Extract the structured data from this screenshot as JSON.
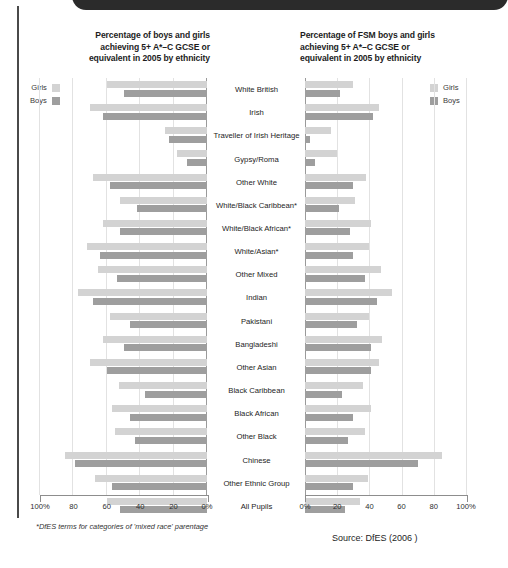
{
  "header": {
    "bar_color": "#2b2b2b"
  },
  "footnote": "*DfES terms for categories of  'mixed race' parentage",
  "source": "Source: DfES (2006 )",
  "legend": {
    "girls_label": "Girls",
    "boys_label": "Boys",
    "girls_color": "#d3d3d3",
    "boys_color": "#9e9e9e"
  },
  "axis": {
    "left_ticks": [
      "100%",
      "80",
      "60",
      "40",
      "20",
      "0%"
    ],
    "right_ticks": [
      "0%",
      "20",
      "40",
      "60",
      "80",
      "100%"
    ]
  },
  "chart_data": [
    {
      "type": "bar",
      "orientation": "horizontal",
      "direction": "right-to-left",
      "title": "Percentage of boys and girls achieving 5+ A*–C GCSE or equivalent in 2005 by ethnicity",
      "title_lines": [
        "Percentage of boys and girls",
        "achieving 5+ A*–C GCSE or",
        "equivalent in 2005 by ethnicity"
      ],
      "xlabel": "",
      "ylabel": "",
      "xlim": [
        0,
        100
      ],
      "xticks": [
        0,
        20,
        40,
        60,
        80,
        100
      ],
      "grid": true,
      "legend_position": "top-left",
      "categories": [
        "White British",
        "Irish",
        "Traveller of Irish Heritage",
        "Gypsy/Roma",
        "Other White",
        "White/Black Caribbean*",
        "White/Black African*",
        "White/Asian*",
        "Other Mixed",
        "Indian",
        "Pakistani",
        "Bangladeshi",
        "Other Asian",
        "Black Caribbean",
        "Black African",
        "Other Black",
        "Chinese",
        "Other Ethnic Group",
        "All Pupils"
      ],
      "series": [
        {
          "name": "Girls",
          "color": "#d3d3d3",
          "values": [
            60,
            70,
            25,
            18,
            68,
            52,
            62,
            72,
            65,
            77,
            58,
            62,
            70,
            53,
            57,
            55,
            85,
            67,
            60
          ]
        },
        {
          "name": "Boys",
          "color": "#9e9e9e",
          "values": [
            50,
            62,
            23,
            12,
            58,
            42,
            52,
            64,
            54,
            68,
            46,
            50,
            60,
            37,
            46,
            43,
            79,
            57,
            52
          ]
        }
      ]
    },
    {
      "type": "bar",
      "orientation": "horizontal",
      "direction": "left-to-right",
      "title": "Percentage of FSM boys and girls achieving 5+ A*–C GCSE or equivalent in 2005 by ethnicity",
      "title_lines": [
        "Percentage of FSM boys and girls",
        "achieving 5+ A*–C GCSE or",
        "equivalent in 2005 by ethnicity"
      ],
      "xlabel": "",
      "ylabel": "",
      "xlim": [
        0,
        100
      ],
      "xticks": [
        0,
        20,
        40,
        60,
        80,
        100
      ],
      "grid": true,
      "legend_position": "top-right",
      "categories": [
        "White British",
        "Irish",
        "Traveller of Irish Heritage",
        "Gypsy/Roma",
        "Other White",
        "White/Black Caribbean*",
        "White/Black African*",
        "White/Asian*",
        "Other Mixed",
        "Indian",
        "Pakistani",
        "Bangladeshi",
        "Other Asian",
        "Black Caribbean",
        "Black African",
        "Other Black",
        "Chinese",
        "Other Ethnic Group",
        "All Pupils"
      ],
      "series": [
        {
          "name": "Girls",
          "color": "#d3d3d3",
          "values": [
            30,
            46,
            16,
            20,
            38,
            31,
            41,
            40,
            47,
            54,
            40,
            48,
            46,
            36,
            41,
            37,
            85,
            39,
            34
          ]
        },
        {
          "name": "Boys",
          "color": "#9e9e9e",
          "values": [
            22,
            42,
            3,
            6,
            30,
            21,
            28,
            30,
            37,
            45,
            32,
            41,
            41,
            23,
            30,
            27,
            70,
            30,
            25
          ]
        }
      ]
    }
  ]
}
